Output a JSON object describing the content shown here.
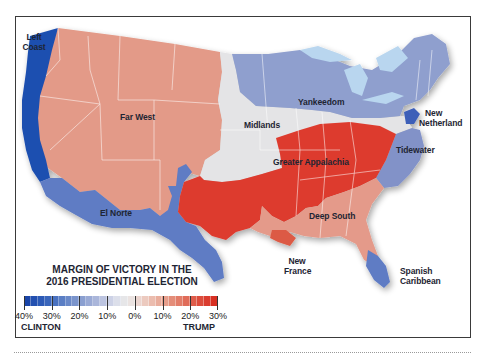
{
  "map": {
    "title_line1": "MARGIN OF VICTORY IN THE",
    "title_line2": "2016 PRESIDENTIAL ELECTION",
    "regions": [
      {
        "id": "left-coast",
        "label_line1": "Left",
        "label_line2": "Coast",
        "winner": "Clinton",
        "color": "#1f4fb0"
      },
      {
        "id": "far-west",
        "label_line1": "Far West",
        "label_line2": "",
        "winner": "Trump",
        "color": "#e39a88"
      },
      {
        "id": "el-norte",
        "label_line1": "El Norte",
        "label_line2": "",
        "winner": "Clinton",
        "color": "#5e7bc4"
      },
      {
        "id": "midlands",
        "label_line1": "Midlands",
        "label_line2": "",
        "winner": "Even",
        "color": "#e4e4e6"
      },
      {
        "id": "yankeedom",
        "label_line1": "Yankeedom",
        "label_line2": "",
        "winner": "Clinton",
        "color": "#8f9fce"
      },
      {
        "id": "new-netherland",
        "label_line1": "New",
        "label_line2": "Netherland",
        "winner": "Clinton",
        "color": "#3c5eb8"
      },
      {
        "id": "greater-appalachia",
        "label_line1": "Greater Appalachia",
        "label_line2": "",
        "winner": "Trump",
        "color": "#dd3b2e"
      },
      {
        "id": "tidewater",
        "label_line1": "Tidewater",
        "label_line2": "",
        "winner": "Clinton",
        "color": "#8292c8"
      },
      {
        "id": "deep-south",
        "label_line1": "Deep South",
        "label_line2": "",
        "winner": "Trump",
        "color": "#e49a8a"
      },
      {
        "id": "new-france",
        "label_line1": "New",
        "label_line2": "France",
        "winner": "Trump",
        "color": "#dc5a44"
      },
      {
        "id": "spanish-caribbean",
        "label_line1": "Spanish",
        "label_line2": "Caribbean",
        "winner": "Clinton",
        "color": "#5e7bc4"
      }
    ],
    "lakes_color": "#b9d6ef"
  },
  "legend": {
    "scale_labels": [
      "40%",
      "30%",
      "20%",
      "10%",
      "0%",
      "10%",
      "20%",
      "30%"
    ],
    "left_label": "CLINTON",
    "right_label": "TRUMP",
    "colors": [
      "#1a45a8",
      "#2350b0",
      "#2c5ab6",
      "#3a66bb",
      "#4a72c0",
      "#5a7ec4",
      "#6a89c8",
      "#7a94cc",
      "#8a9fd0",
      "#9aaad5",
      "#aab6da",
      "#bcc4e0",
      "#cdd2e6",
      "#dcdfea",
      "#e6e6e8",
      "#ebe3e1",
      "#ecd6d0",
      "#eccabf",
      "#ebbcae",
      "#e9ad9c",
      "#e79e8b",
      "#e48d79",
      "#e27d69",
      "#e06c59",
      "#de5c4a",
      "#dc4c3c",
      "#da3c2f",
      "#d83023"
    ]
  }
}
